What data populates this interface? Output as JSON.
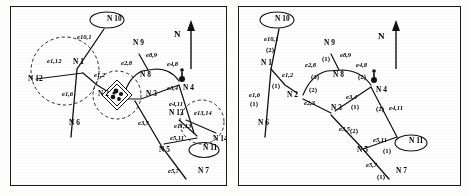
{
  "figure": {
    "panels": [
      {
        "id": "left",
        "name": "network-without-weights",
        "compass_label": "N",
        "nodes": [
          {
            "id": "n10",
            "label": "N 10",
            "x": 96,
            "y": 14,
            "ellipse": true
          },
          {
            "id": "n1",
            "label": "N 1",
            "x": 62,
            "y": 57,
            "ellipse": false
          },
          {
            "id": "n12",
            "label": "N 12",
            "x": 17,
            "y": 74,
            "ellipse": false
          },
          {
            "id": "n6",
            "label": "N 6",
            "x": 58,
            "y": 118,
            "ellipse": false
          },
          {
            "id": "n2",
            "label": "N 2",
            "x": 87,
            "y": 89,
            "ellipse": false
          },
          {
            "id": "n9",
            "label": "N 9",
            "x": 122,
            "y": 38,
            "ellipse": false
          },
          {
            "id": "n8",
            "label": "N 8",
            "x": 129,
            "y": 70,
            "ellipse": false
          },
          {
            "id": "n3",
            "label": "N 3",
            "x": 135,
            "y": 89,
            "ellipse": false
          },
          {
            "id": "n4",
            "label": "N 4",
            "x": 172,
            "y": 83,
            "ellipse": false
          },
          {
            "id": "n13",
            "label": "N 13",
            "x": 158,
            "y": 108,
            "ellipse": false
          },
          {
            "id": "n14",
            "label": "N 14",
            "x": 202,
            "y": 134,
            "ellipse": false
          },
          {
            "id": "n11",
            "label": "N 11",
            "x": 192,
            "y": 143,
            "ellipse": true
          },
          {
            "id": "n5",
            "label": "N 5",
            "x": 148,
            "y": 145,
            "ellipse": false
          },
          {
            "id": "n7",
            "label": "N 7",
            "x": 187,
            "y": 166,
            "ellipse": false
          }
        ],
        "edge_labels": [
          {
            "id": "e10_1",
            "text": "e10,1",
            "x": 66,
            "y": 32
          },
          {
            "id": "e1_12",
            "text": "e1,12",
            "x": 36,
            "y": 56
          },
          {
            "id": "e1_6",
            "text": "e1,6",
            "x": 51,
            "y": 89
          },
          {
            "id": "e1_2",
            "text": "e1,2",
            "x": 83,
            "y": 70
          },
          {
            "id": "e2_8",
            "text": "e2,8",
            "x": 110,
            "y": 58
          },
          {
            "id": "e8_9",
            "text": "e8,9",
            "x": 135,
            "y": 50
          },
          {
            "id": "e4_8",
            "text": "e4,8",
            "x": 156,
            "y": 59
          },
          {
            "id": "e3_4",
            "text": "e3,4",
            "x": 156,
            "y": 83
          },
          {
            "id": "e4_11",
            "text": "e4,11",
            "x": 158,
            "y": 99
          },
          {
            "id": "e13_14",
            "text": "e13,14",
            "x": 183,
            "y": 108
          },
          {
            "id": "e11_13",
            "text": "e11,13",
            "x": 163,
            "y": 121
          },
          {
            "id": "e5_11",
            "text": "e5,11",
            "x": 159,
            "y": 133
          },
          {
            "id": "e3_5",
            "text": "e3,5",
            "x": 127,
            "y": 118
          },
          {
            "id": "e5_7",
            "text": "e5,7",
            "x": 157,
            "y": 166
          }
        ],
        "coverage_circles": 3,
        "facility_symbol": true,
        "pin_symbol": true
      },
      {
        "id": "right",
        "name": "network-with-edge-weights",
        "compass_label": "N",
        "nodes": [
          {
            "id": "n10",
            "label": "N 10",
            "x": 36,
            "y": 14,
            "ellipse": true
          },
          {
            "id": "n1",
            "label": "N 1",
            "x": 22,
            "y": 58,
            "ellipse": false
          },
          {
            "id": "n6",
            "label": "N 6",
            "x": 19,
            "y": 118,
            "ellipse": false
          },
          {
            "id": "n2",
            "label": "N 2",
            "x": 48,
            "y": 90,
            "ellipse": false
          },
          {
            "id": "n9",
            "label": "N 9",
            "x": 85,
            "y": 38,
            "ellipse": false
          },
          {
            "id": "n8",
            "label": "N 8",
            "x": 94,
            "y": 70,
            "ellipse": false
          },
          {
            "id": "n3",
            "label": "N 3",
            "x": 92,
            "y": 103,
            "ellipse": false
          },
          {
            "id": "n4",
            "label": "N 4",
            "x": 137,
            "y": 85,
            "ellipse": false
          },
          {
            "id": "n11",
            "label": "N 11",
            "x": 170,
            "y": 136,
            "ellipse": true
          },
          {
            "id": "n5",
            "label": "N 5",
            "x": 118,
            "y": 145,
            "ellipse": false
          },
          {
            "id": "n7",
            "label": "N 7",
            "x": 157,
            "y": 166,
            "ellipse": false
          }
        ],
        "edge_labels": [
          {
            "id": "e10_1",
            "text": "e10,1",
            "x": 25,
            "y": 34
          },
          {
            "id": "e1_6",
            "text": "e1,6",
            "x": 10,
            "y": 90
          },
          {
            "id": "e1_2",
            "text": "e1,2",
            "x": 43,
            "y": 70
          },
          {
            "id": "e2_8",
            "text": "e2,8",
            "x": 66,
            "y": 60
          },
          {
            "id": "e8_9",
            "text": "e8,9",
            "x": 101,
            "y": 50
          },
          {
            "id": "e4_8",
            "text": "e4,8",
            "x": 117,
            "y": 60
          },
          {
            "id": "e3_4",
            "text": "e3,4",
            "x": 107,
            "y": 92
          },
          {
            "id": "e4_11",
            "text": "e4,11",
            "x": 150,
            "y": 103
          },
          {
            "id": "e2_3",
            "text": "e2,3",
            "x": 65,
            "y": 98
          },
          {
            "id": "e3_5",
            "text": "e3,5",
            "x": 100,
            "y": 124
          },
          {
            "id": "e5_11",
            "text": "e5,11",
            "x": 134,
            "y": 135
          },
          {
            "id": "e5_7",
            "text": "e5,7",
            "x": 127,
            "y": 160
          }
        ],
        "weights": [
          {
            "for": "e10,1",
            "text": "(2)",
            "x": 27,
            "y": 45
          },
          {
            "for": "e1,6",
            "text": "(1)",
            "x": 11,
            "y": 99
          },
          {
            "for": "e1,2",
            "text": "(1)",
            "x": 33,
            "y": 81
          },
          {
            "for": "e2,8",
            "text": "(3)",
            "x": 72,
            "y": 72
          },
          {
            "for": "e8,9",
            "text": "(1)",
            "x": 83,
            "y": 54
          },
          {
            "for": "e4,8",
            "text": "(2)",
            "x": 119,
            "y": 72
          },
          {
            "for": "e2,3",
            "text": "(2)",
            "x": 70,
            "y": 85
          },
          {
            "for": "e3,4",
            "text": "(1)",
            "x": 112,
            "y": 102
          },
          {
            "for": "e4,11",
            "text": "(2)",
            "x": 137,
            "y": 104
          },
          {
            "for": "e3,5",
            "text": "(2)",
            "x": 111,
            "y": 126
          },
          {
            "for": "e5,11",
            "text": "(1)",
            "x": 144,
            "y": 146
          },
          {
            "for": "e5,7",
            "text": "(1)",
            "x": 138,
            "y": 172
          }
        ],
        "coverage_circles": 0,
        "facility_symbol": false,
        "pin_symbol": true
      }
    ]
  },
  "colors": {
    "ink": "#111111",
    "paper": "#ffffff",
    "frame": "#1a1a1a"
  }
}
